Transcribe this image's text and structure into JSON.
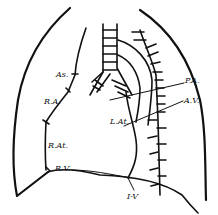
{
  "diagram": {
    "labels": {
      "as": "As.",
      "ra": "R.A.",
      "rat": "R.At.",
      "rv": "R.V.",
      "pa": "P.A.",
      "av": "A.V.",
      "lat": "L.At.",
      "iv": "I-V"
    },
    "colors": {
      "ink": "#111111",
      "background": "#ffffff"
    }
  }
}
